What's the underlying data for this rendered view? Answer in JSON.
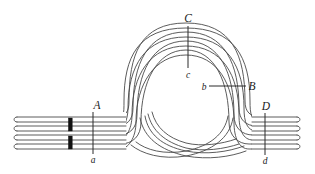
{
  "figure": {
    "background_color": "#ffffff",
    "stroke_color": "#4a4a4a",
    "marker_color": "#111111",
    "strand_count": 4,
    "labels": [
      {
        "id": "C",
        "text": "C",
        "x": 188,
        "y": 22,
        "case": "upper"
      },
      {
        "id": "c",
        "text": "c",
        "x": 188,
        "y": 76,
        "case": "lower"
      },
      {
        "id": "B",
        "text": "B",
        "x": 249,
        "y": 89,
        "case": "upper"
      },
      {
        "id": "b",
        "text": "b",
        "x": 204,
        "y": 90,
        "case": "lower"
      },
      {
        "id": "A",
        "text": "A",
        "x": 97,
        "y": 109,
        "case": "upper"
      },
      {
        "id": "a",
        "text": "a",
        "x": 93,
        "y": 162,
        "case": "lower"
      },
      {
        "id": "D",
        "text": "D",
        "x": 265,
        "y": 110,
        "case": "upper"
      },
      {
        "id": "d",
        "text": "d",
        "x": 265,
        "y": 163,
        "case": "lower"
      }
    ],
    "tick_marks": [
      {
        "id": "tick-A-a",
        "orientation": "vertical",
        "x1": 93,
        "y1": 112,
        "x2": 93,
        "y2": 154
      },
      {
        "id": "tick-D-d",
        "orientation": "vertical",
        "x1": 265,
        "y1": 113,
        "x2": 265,
        "y2": 155
      },
      {
        "id": "tick-C-c",
        "orientation": "vertical",
        "x1": 188,
        "y1": 26,
        "x2": 188,
        "y2": 67
      },
      {
        "id": "tick-B-b",
        "orientation": "horizontal",
        "x1": 209,
        "y1": 86,
        "x2": 245,
        "y2": 86
      }
    ],
    "marker_blocks": [
      {
        "id": "block-upper",
        "x": 69,
        "y": 119,
        "width": 3.6,
        "height": 11
      },
      {
        "id": "block-lower",
        "x": 69,
        "y": 137,
        "width": 3.6,
        "height": 11
      }
    ],
    "strand_paths": [
      {
        "id": "strand-1",
        "description": "outermost strand, enters left, loops widest, exits right",
        "d": "M 17,120 L 116,120 C 128,120 132,116 132,104 C 132,60 140,26 186,26 C 232,26 242,60 242,104 C 242,116 248,120 260,120 L 300,120"
      },
      {
        "id": "strand-2",
        "description": "second strand",
        "d": "M 17,128 L 118,128 C 131,128 136,123 136,110 C 136,68 144,34 186,34 C 228,34 236,68 236,108 C 236,122 243,128 256,128 L 300,128"
      },
      {
        "id": "strand-3",
        "description": "third strand",
        "d": "M 17,137 L 120,137 C 134,137 140,130 140,117 C 140,76 148,42 186,42 C 224,42 230,76 230,113 C 230,127 236,137 250,137 L 300,137"
      },
      {
        "id": "strand-4",
        "description": "innermost strand, enters left, tightest loop, exits right",
        "d": "M 17,146 L 122,146 C 137,146 144,138 144,124 C 144,84 152,50 186,50 C 220,50 224,84 224,118 C 224,132 230,146 245,146 L 300,146"
      }
    ]
  }
}
